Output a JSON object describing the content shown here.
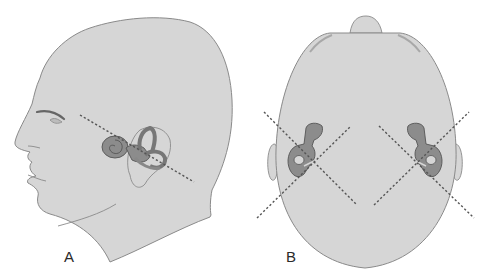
{
  "figure": {
    "panels": [
      {
        "id": "A",
        "label": "A",
        "view": "lateral head profile facing left with inner ear (labyrinth) and dashed plane line"
      },
      {
        "id": "B",
        "label": "B",
        "view": "top view of head with both inner ears and crossing dashed plane lines"
      }
    ],
    "colors": {
      "skin": "#d6d6d6",
      "outline": "#8a8a8a",
      "labyrinth": "#8c8c8c",
      "labyrinth_outline": "#555555",
      "dashed_line": "#555555",
      "background": "#ffffff"
    }
  }
}
